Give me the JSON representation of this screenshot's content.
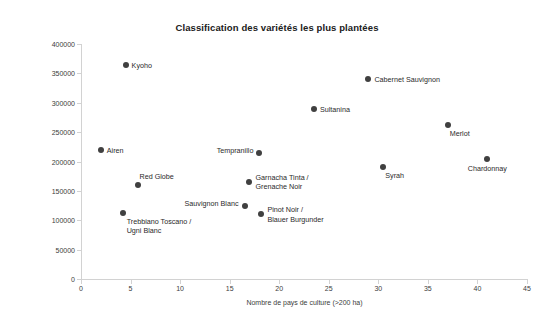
{
  "chart_data": {
    "type": "scatter",
    "title": "Classification des variétés les plus plantées",
    "xlabel": "Nombre de pays de culture (>200 ha)",
    "ylabel": "Surface totale (ha)",
    "xlim": [
      0,
      45
    ],
    "ylim": [
      0,
      400000
    ],
    "xticks": [
      "0",
      "5",
      "10",
      "15",
      "20",
      "25",
      "30",
      "35",
      "40",
      "45"
    ],
    "xtick_values": [
      0,
      5,
      10,
      15,
      20,
      25,
      30,
      35,
      40,
      45
    ],
    "yticks": [
      "0",
      "50000",
      "100000",
      "150000",
      "200000",
      "250000",
      "300000",
      "350000",
      "400000"
    ],
    "ytick_values": [
      0,
      50000,
      100000,
      150000,
      200000,
      250000,
      300000,
      350000,
      400000
    ],
    "grid": false,
    "legend": null,
    "marker_color": "#404040",
    "points": [
      {
        "label": "Kyoho",
        "x": 4.5,
        "y": 365000,
        "label_pos": "right"
      },
      {
        "label": "Cabernet Sauvignon",
        "x": 29.0,
        "y": 340000,
        "label_pos": "right"
      },
      {
        "label": "Sultanina",
        "x": 23.5,
        "y": 290000,
        "label_pos": "right"
      },
      {
        "label": "Merlot",
        "x": 37.0,
        "y": 262000,
        "label_pos": "below-right"
      },
      {
        "label": "Airen",
        "x": 2.0,
        "y": 219000,
        "label_pos": "right"
      },
      {
        "label": "Tempranillo",
        "x": 18.0,
        "y": 215000,
        "label_pos": "left"
      },
      {
        "label": "Chardonnay",
        "x": 41.0,
        "y": 205000,
        "label_pos": "below-center"
      },
      {
        "label": "Syrah",
        "x": 30.5,
        "y": 190000,
        "label_pos": "below-right"
      },
      {
        "label": "Garnacha Tinta /\nGrenache Noir",
        "x": 17.0,
        "y": 165000,
        "label_pos": "right-two-line"
      },
      {
        "label": "Red Globe",
        "x": 5.8,
        "y": 160000,
        "label_pos": "above-right"
      },
      {
        "label": "Sauvignon Blanc",
        "x": 16.5,
        "y": 125000,
        "label_pos": "left"
      },
      {
        "label": "Pinot Noir /\nBlauer Burgunder",
        "x": 18.2,
        "y": 110000,
        "label_pos": "right-two-line"
      },
      {
        "label": "Trebbiano Toscano /\nUgni Blanc",
        "x": 4.2,
        "y": 112000,
        "label_pos": "below-right-two-line"
      }
    ]
  }
}
